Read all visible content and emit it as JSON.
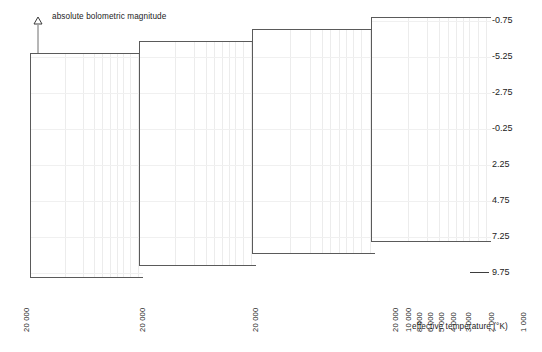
{
  "figure": {
    "width": 542,
    "height": 352,
    "background": "#ffffff",
    "line_color": "#111111",
    "grid_color": "#ececec",
    "frame_color": "#5a5a5a"
  },
  "axes": {
    "y_label": "absolute bolometric magnitude",
    "y_arrow_icon": "up-arrow-icon",
    "y_ticks": [
      {
        "label": "-0.75",
        "y": 20
      },
      {
        "label": "-5.25",
        "y": 56
      },
      {
        "label": "-2.75",
        "y": 92
      },
      {
        "label": "-0.25",
        "y": 128
      },
      {
        "label": "2.25",
        "y": 164
      },
      {
        "label": "4.75",
        "y": 200
      },
      {
        "label": "7.25",
        "y": 236
      },
      {
        "label": "9.75",
        "y": 272
      }
    ],
    "x_title": "effective temperature (°K)",
    "x_ticks_panel1": [
      {
        "label": "20 000",
        "x": 22,
        "y": 332
      }
    ],
    "x_ticks_panel2": [
      {
        "label": "20 000",
        "x": 138,
        "y": 332
      }
    ],
    "x_ticks_panel3": [
      {
        "label": "20 000",
        "x": 251,
        "y": 332
      }
    ],
    "x_ticks_panel4": [
      {
        "label": "20 000",
        "x": 391,
        "y": 332
      },
      {
        "label": "10 000",
        "x": 404,
        "y": 332
      },
      {
        "label": "8 000",
        "x": 415,
        "y": 332
      },
      {
        "label": "6 000",
        "x": 426,
        "y": 332
      },
      {
        "label": "5 000",
        "x": 437,
        "y": 332
      },
      {
        "label": "4 000",
        "x": 449,
        "y": 332
      },
      {
        "label": "3 000",
        "x": 464,
        "y": 332
      },
      {
        "label": "2 000",
        "x": 487,
        "y": 332
      },
      {
        "label": "1 000",
        "x": 519,
        "y": 332
      }
    ],
    "x_title_pos": {
      "x": 412,
      "y": 322
    }
  },
  "panels": [
    {
      "name": "panel-1",
      "left": 30,
      "top": 53,
      "width": 113,
      "height": 225,
      "grid_count": 9
    },
    {
      "name": "panel-2",
      "left": 139,
      "top": 41,
      "width": 117,
      "height": 225,
      "grid_count": 9
    },
    {
      "name": "panel-3",
      "left": 252,
      "top": 29,
      "width": 123,
      "height": 225,
      "grid_count": 9
    },
    {
      "name": "panel-4",
      "left": 371,
      "top": 17,
      "width": 120,
      "height": 225,
      "grid_count": 9
    }
  ],
  "chart_data": {
    "type": "line",
    "title": "",
    "xlabel": "effective temperature (°K)",
    "ylabel": "absolute bolometric magnitude",
    "x_scale": "log-reversed",
    "x_tick_labels": [
      "20 000",
      "10 000",
      "8 000",
      "6 000",
      "5 000",
      "4 000",
      "3 000",
      "2 000",
      "1 000"
    ],
    "y_tick_labels": [
      "-0.75",
      "-5.25",
      "-2.75",
      "-0.25",
      "2.25",
      "4.75",
      "7.25",
      "9.75"
    ],
    "ylim": [
      -0.75,
      9.75
    ],
    "y_inverted": true,
    "grid": true,
    "legend": "none",
    "series": [
      {
        "name": "panel-1-track",
        "panel": 1,
        "note": "short chevron segment, main-sequence stub",
        "points": [
          [
            0.18,
            0.47
          ],
          [
            0.32,
            0.55
          ],
          [
            0.17,
            0.62
          ]
        ]
      },
      {
        "name": "panel-2-track",
        "panel": 2,
        "note": "S-shaped track with dotted evolutionary arrow to the right",
        "points": [
          [
            0.18,
            0.6
          ],
          [
            0.27,
            0.52
          ],
          [
            0.21,
            0.5
          ],
          [
            0.3,
            0.44
          ],
          [
            0.45,
            0.43
          ]
        ]
      },
      {
        "name": "panel-2-arrow",
        "panel": 2,
        "style": "dotted-arrow",
        "points": [
          [
            0.45,
            0.44
          ],
          [
            0.72,
            0.49
          ]
        ]
      },
      {
        "name": "panel-3-track",
        "panel": 3,
        "note": "extended S-track sweeping right with upturned hook",
        "points": [
          [
            0.12,
            0.54
          ],
          [
            0.21,
            0.47
          ],
          [
            0.15,
            0.45
          ],
          [
            0.25,
            0.4
          ],
          [
            0.6,
            0.49
          ],
          [
            0.76,
            0.52
          ],
          [
            0.8,
            0.44
          ]
        ]
      },
      {
        "name": "panel-4-track",
        "panel": 4,
        "note": "full track: S-bend, horizontal sweep, giant-branch loop at upper right",
        "points": [
          [
            0.1,
            0.55
          ],
          [
            0.19,
            0.47
          ],
          [
            0.13,
            0.45
          ],
          [
            0.23,
            0.4
          ],
          [
            0.62,
            0.5
          ],
          [
            0.78,
            0.53
          ],
          [
            0.84,
            0.44
          ]
        ]
      },
      {
        "name": "panel-4-loop",
        "panel": 4,
        "note": "blue-loop / helium-flash feature",
        "points": [
          [
            0.7,
            0.5
          ],
          [
            0.8,
            0.33
          ],
          [
            0.88,
            0.32
          ],
          [
            0.82,
            0.3
          ],
          [
            0.86,
            0.28
          ]
        ]
      }
    ]
  }
}
